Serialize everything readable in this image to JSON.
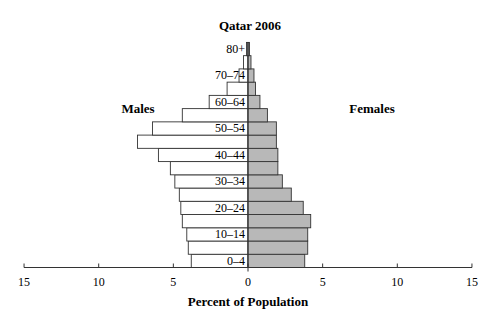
{
  "chart_data": {
    "type": "bar",
    "subtype": "population-pyramid",
    "title": "Qatar 2006",
    "xlabel": "Percent of Population",
    "ylabel": "",
    "left_label": "Males",
    "right_label": "Females",
    "xlim": [
      -15,
      15
    ],
    "xticks": [
      -15,
      -10,
      -5,
      0,
      5,
      10,
      15
    ],
    "xtick_labels": [
      "15",
      "10",
      "5",
      "0",
      "5",
      "10",
      "15"
    ],
    "grid": false,
    "legend": "none",
    "categories": [
      "0–4",
      "5–9",
      "10–14",
      "15–19",
      "20–24",
      "25–29",
      "30–34",
      "35–39",
      "40–44",
      "45–49",
      "50–54",
      "55–59",
      "60–64",
      "65–69",
      "70–74",
      "75–79",
      "80+"
    ],
    "visible_category_labels": [
      "0–4",
      "10–14",
      "20–24",
      "30–34",
      "40–44",
      "50–54",
      "60–64",
      "70–74",
      "80+"
    ],
    "series": [
      {
        "name": "Males",
        "color": "#ffffff",
        "values": [
          3.8,
          4.0,
          4.1,
          4.4,
          4.5,
          4.6,
          4.9,
          5.2,
          6.0,
          7.4,
          6.4,
          4.4,
          2.6,
          1.4,
          0.6,
          0.3,
          0.1
        ]
      },
      {
        "name": "Females",
        "color": "#b8b8b8",
        "values": [
          3.8,
          4.0,
          4.0,
          4.2,
          3.7,
          2.9,
          2.3,
          2.0,
          2.0,
          1.9,
          1.9,
          1.3,
          0.8,
          0.5,
          0.4,
          0.2,
          0.1
        ]
      }
    ]
  }
}
